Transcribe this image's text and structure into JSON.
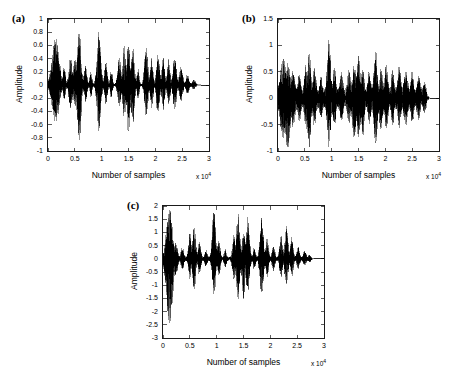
{
  "figure": {
    "background": "#ffffff",
    "line_color": "#000000",
    "axis_color": "#1a1a1a",
    "panel_count": 3
  },
  "chart_data": [
    {
      "type": "line",
      "panel": "a",
      "label": "(a)",
      "title": "",
      "xlabel": "Number of samples",
      "ylabel": "Amplitude",
      "xlim": [
        0,
        3
      ],
      "ylim": [
        -1,
        1
      ],
      "x_exponent": "x 10",
      "x_exponent_power": "4",
      "x_ticks": [
        0,
        0.5,
        1,
        1.5,
        2,
        2.5,
        3
      ],
      "x_ticklabels": [
        "0",
        "0.5",
        "1",
        "1.5",
        "2",
        "2.5",
        "3"
      ],
      "y_ticks": [
        -1,
        -0.8,
        -0.6,
        -0.4,
        -0.2,
        0,
        0.2,
        0.4,
        0.6,
        0.8,
        1
      ],
      "y_ticklabels": [
        "-1",
        "-0.8",
        "-0.6",
        "-0.4",
        "-0.2",
        "0",
        "0.2",
        "0.4",
        "0.6",
        "0.8",
        "1"
      ],
      "grid": false,
      "signal_description": "Clean speech waveform, silence gaps between bursts",
      "noise_floor": 0.012,
      "signal_end_x": 2.85,
      "bursts": [
        {
          "center": 0.14,
          "width": 0.13,
          "peak_pos": 0.72,
          "peak_neg": -0.58
        },
        {
          "center": 0.3,
          "width": 0.05,
          "peak_pos": 0.26,
          "peak_neg": -0.22
        },
        {
          "center": 0.42,
          "width": 0.06,
          "peak_pos": 0.44,
          "peak_neg": -0.38
        },
        {
          "center": 0.5,
          "width": 0.05,
          "peak_pos": 0.4,
          "peak_neg": -0.34
        },
        {
          "center": 0.58,
          "width": 0.07,
          "peak_pos": 0.83,
          "peak_neg": -0.88
        },
        {
          "center": 0.7,
          "width": 0.05,
          "peak_pos": 0.3,
          "peak_neg": -0.26
        },
        {
          "center": 0.8,
          "width": 0.04,
          "peak_pos": 0.2,
          "peak_neg": -0.17
        },
        {
          "center": 0.95,
          "width": 0.07,
          "peak_pos": 0.81,
          "peak_neg": -0.7
        },
        {
          "center": 1.08,
          "width": 0.05,
          "peak_pos": 0.33,
          "peak_neg": -0.28
        },
        {
          "center": 1.18,
          "width": 0.04,
          "peak_pos": 0.22,
          "peak_neg": -0.19
        },
        {
          "center": 1.33,
          "width": 0.06,
          "peak_pos": 0.4,
          "peak_neg": -0.33
        },
        {
          "center": 1.42,
          "width": 0.06,
          "peak_pos": 0.58,
          "peak_neg": -0.5
        },
        {
          "center": 1.5,
          "width": 0.06,
          "peak_pos": 0.64,
          "peak_neg": -0.74
        },
        {
          "center": 1.58,
          "width": 0.06,
          "peak_pos": 0.55,
          "peak_neg": -0.62
        },
        {
          "center": 1.68,
          "width": 0.04,
          "peak_pos": 0.24,
          "peak_neg": -0.21
        },
        {
          "center": 1.83,
          "width": 0.06,
          "peak_pos": 0.62,
          "peak_neg": -0.52
        },
        {
          "center": 1.93,
          "width": 0.05,
          "peak_pos": 0.42,
          "peak_neg": -0.36
        },
        {
          "center": 2.05,
          "width": 0.06,
          "peak_pos": 0.52,
          "peak_neg": -0.46
        },
        {
          "center": 2.15,
          "width": 0.05,
          "peak_pos": 0.47,
          "peak_neg": -0.4
        },
        {
          "center": 2.25,
          "width": 0.05,
          "peak_pos": 0.38,
          "peak_neg": -0.32
        },
        {
          "center": 2.36,
          "width": 0.06,
          "peak_pos": 0.44,
          "peak_neg": -0.38
        },
        {
          "center": 2.48,
          "width": 0.06,
          "peak_pos": 0.28,
          "peak_neg": -0.24
        },
        {
          "center": 2.6,
          "width": 0.06,
          "peak_pos": 0.15,
          "peak_neg": -0.13
        },
        {
          "center": 2.72,
          "width": 0.06,
          "peak_pos": 0.07,
          "peak_neg": -0.06
        }
      ]
    },
    {
      "type": "line",
      "panel": "b",
      "label": "(b)",
      "title": "",
      "xlabel": "Number of samples",
      "ylabel": "Amplitude",
      "xlim": [
        0,
        3
      ],
      "ylim": [
        -1,
        1.5
      ],
      "x_exponent": "x 10",
      "x_exponent_power": "4",
      "x_ticks": [
        0,
        0.5,
        1,
        1.5,
        2,
        2.5,
        3
      ],
      "x_ticklabels": [
        "0",
        "0.5",
        "1",
        "1.5",
        "2",
        "2.5",
        "3"
      ],
      "y_ticks": [
        -1,
        -0.5,
        0,
        0.5,
        1,
        1.5
      ],
      "y_ticklabels": [
        "-1",
        "-0.5",
        "0",
        "0.5",
        "1",
        "1.5"
      ],
      "grid": false,
      "signal_description": "Noisy speech waveform, continuous noise floor filling gaps",
      "noise_floor": 0.165,
      "signal_end_x": 2.83,
      "bursts": [
        {
          "center": 0.1,
          "width": 0.1,
          "peak_pos": 0.62,
          "peak_neg": -0.62
        },
        {
          "center": 0.18,
          "width": 0.09,
          "peak_pos": 0.52,
          "peak_neg": -0.8
        },
        {
          "center": 0.28,
          "width": 0.06,
          "peak_pos": 0.38,
          "peak_neg": -0.42
        },
        {
          "center": 0.4,
          "width": 0.05,
          "peak_pos": 0.32,
          "peak_neg": -0.3
        },
        {
          "center": 0.52,
          "width": 0.05,
          "peak_pos": 0.48,
          "peak_neg": -0.44
        },
        {
          "center": 0.58,
          "width": 0.06,
          "peak_pos": 0.73,
          "peak_neg": -0.82
        },
        {
          "center": 0.68,
          "width": 0.05,
          "peak_pos": 0.42,
          "peak_neg": -0.38
        },
        {
          "center": 0.8,
          "width": 0.04,
          "peak_pos": 0.26,
          "peak_neg": -0.24
        },
        {
          "center": 0.95,
          "width": 0.06,
          "peak_pos": 1.02,
          "peak_neg": -0.78
        },
        {
          "center": 1.05,
          "width": 0.05,
          "peak_pos": 0.42,
          "peak_neg": -0.38
        },
        {
          "center": 1.18,
          "width": 0.05,
          "peak_pos": 0.33,
          "peak_neg": -0.3
        },
        {
          "center": 1.32,
          "width": 0.05,
          "peak_pos": 0.4,
          "peak_neg": -0.36
        },
        {
          "center": 1.42,
          "width": 0.06,
          "peak_pos": 0.48,
          "peak_neg": -0.66
        },
        {
          "center": 1.5,
          "width": 0.06,
          "peak_pos": 0.68,
          "peak_neg": -0.62
        },
        {
          "center": 1.58,
          "width": 0.05,
          "peak_pos": 0.45,
          "peak_neg": -0.58
        },
        {
          "center": 1.7,
          "width": 0.05,
          "peak_pos": 0.36,
          "peak_neg": -0.33
        },
        {
          "center": 1.82,
          "width": 0.06,
          "peak_pos": 0.72,
          "peak_neg": -0.74
        },
        {
          "center": 1.92,
          "width": 0.05,
          "peak_pos": 0.45,
          "peak_neg": -0.5
        },
        {
          "center": 2.02,
          "width": 0.05,
          "peak_pos": 0.5,
          "peak_neg": -0.42
        },
        {
          "center": 2.14,
          "width": 0.05,
          "peak_pos": 0.4,
          "peak_neg": -0.36
        },
        {
          "center": 2.26,
          "width": 0.05,
          "peak_pos": 0.44,
          "peak_neg": -0.4
        },
        {
          "center": 2.38,
          "width": 0.06,
          "peak_pos": 0.42,
          "peak_neg": -0.38
        },
        {
          "center": 2.5,
          "width": 0.05,
          "peak_pos": 0.34,
          "peak_neg": -0.3
        },
        {
          "center": 2.62,
          "width": 0.05,
          "peak_pos": 0.28,
          "peak_neg": -0.26
        },
        {
          "center": 2.74,
          "width": 0.05,
          "peak_pos": 0.24,
          "peak_neg": -0.22
        }
      ]
    },
    {
      "type": "line",
      "panel": "c",
      "label": "(c)",
      "title": "",
      "xlabel": "Number of samples",
      "ylabel": "Amplitude",
      "xlim": [
        0,
        3
      ],
      "ylim": [
        -3,
        2
      ],
      "x_exponent": "x 10",
      "x_exponent_power": "4",
      "x_ticks": [
        0,
        0.5,
        1,
        1.5,
        2,
        2.5,
        3
      ],
      "x_ticklabels": [
        "0",
        "0.5",
        "1",
        "1.5",
        "2",
        "2.5",
        "3"
      ],
      "y_ticks": [
        -3,
        -2.5,
        -2,
        -1.5,
        -1,
        -0.5,
        0,
        0.5,
        1,
        1.5,
        2
      ],
      "y_ticklabels": [
        "-3",
        "-2.5",
        "-2",
        "-1.5",
        "-1",
        "-0.5",
        "0",
        "0.5",
        "1",
        "1.5",
        "2"
      ],
      "grid": false,
      "signal_description": "Enhanced speech waveform, larger amplitude range, low noise floor",
      "noise_floor": 0.055,
      "signal_end_x": 2.82,
      "bursts": [
        {
          "center": 0.12,
          "width": 0.11,
          "peak_pos": 1.85,
          "peak_neg": -2.62
        },
        {
          "center": 0.24,
          "width": 0.06,
          "peak_pos": 0.55,
          "peak_neg": -0.6
        },
        {
          "center": 0.36,
          "width": 0.05,
          "peak_pos": 0.4,
          "peak_neg": -0.36
        },
        {
          "center": 0.5,
          "width": 0.05,
          "peak_pos": 0.95,
          "peak_neg": -0.75
        },
        {
          "center": 0.58,
          "width": 0.06,
          "peak_pos": 1.22,
          "peak_neg": -1.18
        },
        {
          "center": 0.68,
          "width": 0.05,
          "peak_pos": 0.62,
          "peak_neg": -0.58
        },
        {
          "center": 0.8,
          "width": 0.04,
          "peak_pos": 0.3,
          "peak_neg": -0.28
        },
        {
          "center": 0.95,
          "width": 0.06,
          "peak_pos": 1.9,
          "peak_neg": -1.35
        },
        {
          "center": 1.04,
          "width": 0.05,
          "peak_pos": 0.7,
          "peak_neg": -0.62
        },
        {
          "center": 1.16,
          "width": 0.04,
          "peak_pos": 0.32,
          "peak_neg": -0.3
        },
        {
          "center": 1.32,
          "width": 0.05,
          "peak_pos": 0.9,
          "peak_neg": -0.8
        },
        {
          "center": 1.4,
          "width": 0.06,
          "peak_pos": 1.72,
          "peak_neg": -1.5
        },
        {
          "center": 1.5,
          "width": 0.05,
          "peak_pos": 1.05,
          "peak_neg": -1.62
        },
        {
          "center": 1.58,
          "width": 0.06,
          "peak_pos": 1.55,
          "peak_neg": -1.22
        },
        {
          "center": 1.7,
          "width": 0.04,
          "peak_pos": 0.4,
          "peak_neg": -0.36
        },
        {
          "center": 1.84,
          "width": 0.06,
          "peak_pos": 1.58,
          "peak_neg": -1.48
        },
        {
          "center": 1.94,
          "width": 0.05,
          "peak_pos": 0.72,
          "peak_neg": -0.66
        },
        {
          "center": 2.06,
          "width": 0.05,
          "peak_pos": 0.48,
          "peak_neg": -0.44
        },
        {
          "center": 2.2,
          "width": 0.05,
          "peak_pos": 0.85,
          "peak_neg": -0.7
        },
        {
          "center": 2.3,
          "width": 0.06,
          "peak_pos": 1.18,
          "peak_neg": -0.95
        },
        {
          "center": 2.4,
          "width": 0.05,
          "peak_pos": 0.8,
          "peak_neg": -0.68
        },
        {
          "center": 2.52,
          "width": 0.05,
          "peak_pos": 0.4,
          "peak_neg": -0.36
        },
        {
          "center": 2.64,
          "width": 0.05,
          "peak_pos": 0.26,
          "peak_neg": -0.24
        },
        {
          "center": 2.74,
          "width": 0.05,
          "peak_pos": 0.16,
          "peak_neg": -0.15
        }
      ]
    }
  ],
  "layout": {
    "panels": [
      {
        "key": "a",
        "box_left": 47,
        "box_top": 18,
        "box_width": 163,
        "box_height": 134
      },
      {
        "key": "b",
        "box_left": 277,
        "box_top": 18,
        "box_width": 163,
        "box_height": 134
      },
      {
        "key": "c",
        "box_left": 162,
        "box_top": 205,
        "box_width": 163,
        "box_height": 134
      }
    ]
  }
}
